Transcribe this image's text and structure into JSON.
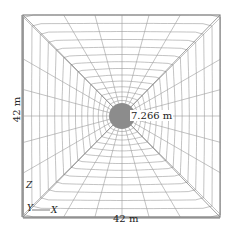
{
  "diagram": {
    "type": "finite-element mesh (top view)",
    "domain": {
      "width_label": "42 m",
      "height_label": "42 m"
    },
    "inclusion": {
      "radius_label": "7.266 m",
      "fill": "#8c8c8c"
    },
    "axes": {
      "z": "Z",
      "y": "Y",
      "x": "X"
    },
    "mesh": {
      "line_color": "#9a9a9a",
      "frame_color": "#888888",
      "radial_lines": 24,
      "rings": 14
    }
  }
}
